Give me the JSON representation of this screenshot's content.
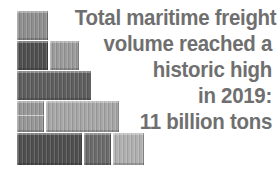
{
  "graphic": {
    "name": "stacked-shipping-containers",
    "description": "Staircase stack of shipping containers forming a descending pyramid",
    "colors": {
      "background": "#ffffff",
      "text_gray": "#6f6f6f",
      "shade_light": "#b9b9b9",
      "shade_mid_light": "#a6a6a6",
      "shade_mid": "#8f8f8f",
      "shade_mid_dark": "#7a7a7a",
      "shade_dark": "#5e5e5e",
      "shade_darkest": "#4f4f4f"
    },
    "rows": [
      {
        "row_label": "row-1-top",
        "left": 17,
        "top": 11,
        "height": 29,
        "containers": [
          {
            "label": "container-1-1",
            "width": 31,
            "color": "#8f8f8f",
            "mid_band": false
          }
        ]
      },
      {
        "row_label": "row-2",
        "left": 17,
        "top": 41,
        "height": 29,
        "containers": [
          {
            "label": "container-2-1",
            "width": 31,
            "color": "#4f4f4f",
            "mid_band": false
          },
          {
            "label": "container-2-2",
            "width": 29,
            "color": "#9b9b9b",
            "mid_band": false
          }
        ]
      },
      {
        "row_label": "row-3",
        "left": 17,
        "top": 71,
        "height": 29,
        "containers": [
          {
            "label": "container-3-1",
            "width": 74,
            "color": "#5e5e5e",
            "mid_band": false
          }
        ]
      },
      {
        "row_label": "row-4",
        "left": 17,
        "top": 101,
        "height": 31,
        "containers": [
          {
            "label": "container-4-1",
            "width": 27,
            "color": "#979797",
            "mid_band": true
          },
          {
            "label": "container-4-2",
            "width": 73,
            "color": "#a6a6a6",
            "mid_band": false
          }
        ]
      },
      {
        "row_label": "row-5-bottom",
        "left": 17,
        "top": 133,
        "height": 32,
        "containers": [
          {
            "label": "container-5-1",
            "width": 65,
            "color": "#4f4f4f",
            "mid_band": false
          },
          {
            "label": "container-5-2",
            "width": 27,
            "color": "#6b6b6b",
            "mid_band": false
          },
          {
            "label": "container-5-3",
            "width": 31,
            "color": "#b0b0b0",
            "mid_band": false
          }
        ]
      }
    ]
  },
  "headline": {
    "full_text": "Total maritime freight volume reached a historic high in 2019: 11 billion tons",
    "lines": [
      "Total maritime freight",
      "volume reached a",
      "historic high",
      "in 2019:",
      "11 billion tons"
    ],
    "year": "2019",
    "volume": "11 billion tons"
  }
}
